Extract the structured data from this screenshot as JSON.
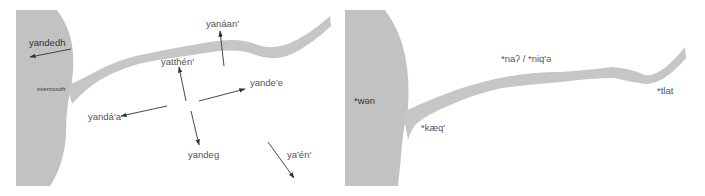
{
  "colors": {
    "land": "#c2c2c2",
    "river": "#c6c6c6",
    "arrow": "#333333",
    "text": "#555555",
    "background": "#ffffff"
  },
  "left_panel": {
    "landmass_label": "yandedh",
    "rivermouth_label": "rivermouth",
    "directions": [
      {
        "label": "yandedh",
        "meaning_direction": "toward sea (west)"
      },
      {
        "label": "yanáan'",
        "meaning_direction": "up/away from river (north)"
      },
      {
        "label": "yatthén'",
        "meaning_direction": "toward river (north-west)"
      },
      {
        "label": "yande'e",
        "meaning_direction": "upriver (east)"
      },
      {
        "label": "yandá'a",
        "meaning_direction": "downriver (west)"
      },
      {
        "label": "yandeg",
        "meaning_direction": "away from river (south)"
      },
      {
        "label": "ya'én'",
        "meaning_direction": "south-east"
      }
    ]
  },
  "right_panel": {
    "labels": [
      {
        "label": "*wən",
        "location": "sea/landmass"
      },
      {
        "label": "*kæq'",
        "location": "river mouth"
      },
      {
        "label": "*naʔ / *niq'ə",
        "location": "along river"
      },
      {
        "label": "*tlat",
        "location": "upriver end"
      }
    ]
  }
}
